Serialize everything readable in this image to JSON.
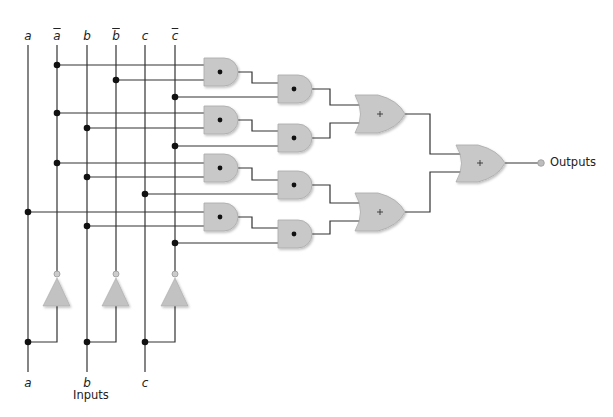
{
  "diagram": {
    "type": "combinational-logic-circuit",
    "colors": {
      "wire": "#333333",
      "gate_fill": "#c8c8c8",
      "gate_edge": "#a9a9a9",
      "dot": "#111111",
      "output_bubble": "#bdbdbd"
    },
    "top_labels": [
      {
        "id": "a",
        "text": "a",
        "negated": false
      },
      {
        "id": "a_not",
        "text": "a",
        "negated": true
      },
      {
        "id": "b",
        "text": "b",
        "negated": false
      },
      {
        "id": "b_not",
        "text": "b",
        "negated": true
      },
      {
        "id": "c",
        "text": "c",
        "negated": false
      },
      {
        "id": "c_not",
        "text": "c",
        "negated": true
      }
    ],
    "bottom_labels": [
      {
        "id": "a",
        "text": "a"
      },
      {
        "id": "b",
        "text": "b"
      },
      {
        "id": "c",
        "text": "c"
      }
    ],
    "inputs_caption": "Inputs",
    "outputs_caption": "Outputs",
    "and_gate_symbol": "•",
    "or_gate_symbol": "+",
    "gates": {
      "and_stage1": [
        {
          "id": "and1",
          "inputs": [
            "a_not",
            "b_not"
          ]
        },
        {
          "id": "and2",
          "inputs": [
            "a_not",
            "b"
          ]
        },
        {
          "id": "and3",
          "inputs": [
            "a_not",
            "b"
          ]
        },
        {
          "id": "and4",
          "inputs": [
            "a",
            "b"
          ]
        }
      ],
      "and_stage2": [
        {
          "id": "and1b",
          "inputs": [
            "and1",
            "c_not"
          ]
        },
        {
          "id": "and2b",
          "inputs": [
            "and2",
            "c_not"
          ]
        },
        {
          "id": "and3b",
          "inputs": [
            "and3",
            "c"
          ]
        },
        {
          "id": "and4b",
          "inputs": [
            "and4",
            "c_not"
          ]
        }
      ],
      "or_stage1": [
        {
          "id": "or1",
          "inputs": [
            "and1b",
            "and2b"
          ]
        },
        {
          "id": "or2",
          "inputs": [
            "and3b",
            "and4b"
          ]
        }
      ],
      "or_final": {
        "id": "or3",
        "inputs": [
          "or1",
          "or2"
        ]
      },
      "inverters": [
        {
          "id": "inv_a",
          "input": "a",
          "output": "a_not"
        },
        {
          "id": "inv_b",
          "input": "b",
          "output": "b_not"
        },
        {
          "id": "inv_c",
          "input": "c",
          "output": "c_not"
        }
      ]
    }
  }
}
